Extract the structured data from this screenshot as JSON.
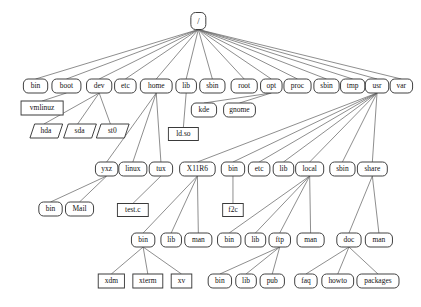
{
  "diagram": {
    "background_color": "#ffffff",
    "node_fill": "#ffffff",
    "node_stroke": "#333333",
    "edge_color": "#6d6d6d",
    "text_color": "#111111",
    "shape_legend": {
      "rounded": "directory",
      "rect": "file",
      "parallelogram": "device-node"
    },
    "nodes": [
      {
        "id": "root",
        "label": "/",
        "shape": "rounded",
        "x": 212,
        "y": 21,
        "w": 16,
        "h": 17,
        "fs": 9
      },
      {
        "id": "bin",
        "label": "bin",
        "shape": "rounded",
        "x": 38,
        "y": 86,
        "w": 26,
        "h": 14,
        "fs": 8
      },
      {
        "id": "boot",
        "label": "boot",
        "shape": "rounded",
        "x": 71,
        "y": 86,
        "w": 31,
        "h": 14,
        "fs": 8
      },
      {
        "id": "dev",
        "label": "dev",
        "shape": "rounded",
        "x": 106,
        "y": 86,
        "w": 27,
        "h": 14,
        "fs": 8
      },
      {
        "id": "etc",
        "label": "etc",
        "shape": "rounded",
        "x": 134,
        "y": 86,
        "w": 23,
        "h": 14,
        "fs": 8
      },
      {
        "id": "home",
        "label": "home",
        "shape": "rounded",
        "x": 167,
        "y": 86,
        "w": 34,
        "h": 14,
        "fs": 8
      },
      {
        "id": "lib",
        "label": "lib",
        "shape": "rounded",
        "x": 199,
        "y": 86,
        "w": 22,
        "h": 14,
        "fs": 8
      },
      {
        "id": "sbin2",
        "label": "sbin",
        "shape": "rounded",
        "x": 227,
        "y": 86,
        "w": 27,
        "h": 14,
        "fs": 8
      },
      {
        "id": "rootdir",
        "label": "root",
        "shape": "rounded",
        "x": 261,
        "y": 86,
        "w": 28,
        "h": 14,
        "fs": 8
      },
      {
        "id": "opt",
        "label": "opt",
        "shape": "rounded",
        "x": 290,
        "y": 86,
        "w": 23,
        "h": 14,
        "fs": 8
      },
      {
        "id": "proc",
        "label": "proc",
        "shape": "rounded",
        "x": 318,
        "y": 86,
        "w": 29,
        "h": 14,
        "fs": 8
      },
      {
        "id": "sbin3",
        "label": "sbin",
        "shape": "rounded",
        "x": 349,
        "y": 86,
        "w": 27,
        "h": 14,
        "fs": 8
      },
      {
        "id": "tmp",
        "label": "tmp",
        "shape": "rounded",
        "x": 377,
        "y": 86,
        "w": 26,
        "h": 14,
        "fs": 8
      },
      {
        "id": "usr",
        "label": "usr",
        "shape": "rounded",
        "x": 403,
        "y": 86,
        "w": 25,
        "h": 14,
        "fs": 8
      },
      {
        "id": "var",
        "label": "var",
        "shape": "rounded",
        "x": 429,
        "y": 86,
        "w": 24,
        "h": 14,
        "fs": 8
      },
      {
        "id": "vmlinuz",
        "label": "vmlinuz",
        "shape": "rect",
        "x": 45,
        "y": 108,
        "w": 45,
        "h": 14,
        "fs": 8
      },
      {
        "id": "kde",
        "label": "kde",
        "shape": "rounded",
        "x": 218,
        "y": 110,
        "w": 27,
        "h": 14,
        "fs": 8
      },
      {
        "id": "gnome",
        "label": "gnome",
        "shape": "rounded",
        "x": 256,
        "y": 110,
        "w": 34,
        "h": 14,
        "fs": 8
      },
      {
        "id": "hda",
        "label": "hda",
        "shape": "para",
        "x": 47,
        "y": 131,
        "w": 30,
        "h": 14,
        "fs": 8
      },
      {
        "id": "sda",
        "label": "sda",
        "shape": "para",
        "x": 83,
        "y": 131,
        "w": 30,
        "h": 14,
        "fs": 8
      },
      {
        "id": "st0",
        "label": "st0",
        "shape": "para",
        "x": 118,
        "y": 131,
        "w": 30,
        "h": 14,
        "fs": 8
      },
      {
        "id": "ldso",
        "label": "ld.so",
        "shape": "rect",
        "x": 196,
        "y": 134,
        "w": 32,
        "h": 13,
        "fs": 8
      },
      {
        "id": "yxz",
        "label": "yxz",
        "shape": "rounded",
        "x": 114,
        "y": 169,
        "w": 24,
        "h": 14,
        "fs": 8
      },
      {
        "id": "linux",
        "label": "linux",
        "shape": "rounded",
        "x": 142,
        "y": 169,
        "w": 30,
        "h": 14,
        "fs": 8
      },
      {
        "id": "tux",
        "label": "tux",
        "shape": "rounded",
        "x": 172,
        "y": 169,
        "w": 25,
        "h": 14,
        "fs": 8
      },
      {
        "id": "x11r6",
        "label": "X11R6",
        "shape": "rounded",
        "x": 211,
        "y": 169,
        "w": 38,
        "h": 14,
        "fs": 8
      },
      {
        "id": "usrbin",
        "label": "bin",
        "shape": "rounded",
        "x": 249,
        "y": 169,
        "w": 25,
        "h": 14,
        "fs": 8
      },
      {
        "id": "usretc",
        "label": "etc",
        "shape": "rounded",
        "x": 277,
        "y": 169,
        "w": 23,
        "h": 14,
        "fs": 8
      },
      {
        "id": "usrlib",
        "label": "lib",
        "shape": "rounded",
        "x": 303,
        "y": 169,
        "w": 22,
        "h": 14,
        "fs": 8
      },
      {
        "id": "local",
        "label": "local",
        "shape": "rounded",
        "x": 331,
        "y": 169,
        "w": 30,
        "h": 14,
        "fs": 8
      },
      {
        "id": "usrsbin",
        "label": "sbin",
        "shape": "rounded",
        "x": 366,
        "y": 169,
        "w": 27,
        "h": 14,
        "fs": 8
      },
      {
        "id": "share",
        "label": "share",
        "shape": "rounded",
        "x": 398,
        "y": 169,
        "w": 32,
        "h": 14,
        "fs": 8
      },
      {
        "id": "homebin",
        "label": "bin",
        "shape": "rounded",
        "x": 54,
        "y": 209,
        "w": 25,
        "h": 14,
        "fs": 8
      },
      {
        "id": "mail",
        "label": "Mail",
        "shape": "rounded",
        "x": 85,
        "y": 209,
        "w": 30,
        "h": 14,
        "fs": 8
      },
      {
        "id": "testc",
        "label": "test.c",
        "shape": "rect",
        "x": 142,
        "y": 210,
        "w": 33,
        "h": 13,
        "fs": 8
      },
      {
        "id": "f2c",
        "label": "f2c",
        "shape": "rect",
        "x": 249,
        "y": 210,
        "w": 22,
        "h": 13,
        "fs": 8
      },
      {
        "id": "x11bin",
        "label": "bin",
        "shape": "rounded",
        "x": 153,
        "y": 240,
        "w": 25,
        "h": 14,
        "fs": 8
      },
      {
        "id": "x11lib",
        "label": "lib",
        "shape": "rounded",
        "x": 183,
        "y": 240,
        "w": 22,
        "h": 14,
        "fs": 8
      },
      {
        "id": "x11man",
        "label": "man",
        "shape": "rounded",
        "x": 212,
        "y": 240,
        "w": 29,
        "h": 14,
        "fs": 8
      },
      {
        "id": "locbin",
        "label": "bin",
        "shape": "rounded",
        "x": 245,
        "y": 240,
        "w": 25,
        "h": 14,
        "fs": 8
      },
      {
        "id": "loclib",
        "label": "lib",
        "shape": "rounded",
        "x": 273,
        "y": 240,
        "w": 22,
        "h": 14,
        "fs": 8
      },
      {
        "id": "ftp",
        "label": "ftp",
        "shape": "rounded",
        "x": 299,
        "y": 240,
        "w": 23,
        "h": 14,
        "fs": 8
      },
      {
        "id": "locman",
        "label": "man",
        "shape": "rounded",
        "x": 332,
        "y": 240,
        "w": 29,
        "h": 14,
        "fs": 8
      },
      {
        "id": "doc",
        "label": "doc",
        "shape": "rounded",
        "x": 373,
        "y": 240,
        "w": 26,
        "h": 14,
        "fs": 8
      },
      {
        "id": "shareman",
        "label": "man",
        "shape": "rounded",
        "x": 405,
        "y": 240,
        "w": 29,
        "h": 14,
        "fs": 8
      },
      {
        "id": "xdm",
        "label": "xdm",
        "shape": "rect",
        "x": 119,
        "y": 281,
        "w": 28,
        "h": 14,
        "fs": 8
      },
      {
        "id": "xterm",
        "label": "xterm",
        "shape": "rect",
        "x": 158,
        "y": 281,
        "w": 32,
        "h": 14,
        "fs": 8
      },
      {
        "id": "xv",
        "label": "xv",
        "shape": "rect",
        "x": 194,
        "y": 281,
        "w": 22,
        "h": 14,
        "fs": 8
      },
      {
        "id": "ftpbin",
        "label": "bin",
        "shape": "rounded",
        "x": 235,
        "y": 281,
        "w": 25,
        "h": 14,
        "fs": 8
      },
      {
        "id": "ftplib",
        "label": "lib",
        "shape": "rounded",
        "x": 263,
        "y": 281,
        "w": 22,
        "h": 14,
        "fs": 8
      },
      {
        "id": "pub",
        "label": "pub",
        "shape": "rounded",
        "x": 291,
        "y": 281,
        "w": 26,
        "h": 14,
        "fs": 8
      },
      {
        "id": "faq",
        "label": "faq",
        "shape": "rounded",
        "x": 327,
        "y": 281,
        "w": 24,
        "h": 14,
        "fs": 8
      },
      {
        "id": "howto",
        "label": "howto",
        "shape": "rounded",
        "x": 361,
        "y": 281,
        "w": 34,
        "h": 14,
        "fs": 8
      },
      {
        "id": "packages",
        "label": "packages",
        "shape": "rounded",
        "x": 404,
        "y": 281,
        "w": 45,
        "h": 14,
        "fs": 8
      }
    ],
    "edges": [
      {
        "from": "root",
        "to": "bin"
      },
      {
        "from": "root",
        "to": "boot"
      },
      {
        "from": "root",
        "to": "dev"
      },
      {
        "from": "root",
        "to": "etc"
      },
      {
        "from": "root",
        "to": "home"
      },
      {
        "from": "root",
        "to": "lib"
      },
      {
        "from": "root",
        "to": "sbin2"
      },
      {
        "from": "root",
        "to": "rootdir"
      },
      {
        "from": "root",
        "to": "opt"
      },
      {
        "from": "root",
        "to": "proc"
      },
      {
        "from": "root",
        "to": "sbin3"
      },
      {
        "from": "root",
        "to": "tmp"
      },
      {
        "from": "root",
        "to": "usr"
      },
      {
        "from": "root",
        "to": "var"
      },
      {
        "from": "boot",
        "to": "vmlinuz"
      },
      {
        "from": "dev",
        "to": "hda"
      },
      {
        "from": "dev",
        "to": "sda"
      },
      {
        "from": "dev",
        "to": "st0"
      },
      {
        "from": "lib",
        "to": "ldso"
      },
      {
        "from": "opt",
        "to": "kde"
      },
      {
        "from": "opt",
        "to": "gnome"
      },
      {
        "from": "home",
        "to": "yxz"
      },
      {
        "from": "home",
        "to": "linux"
      },
      {
        "from": "home",
        "to": "tux"
      },
      {
        "from": "usr",
        "to": "x11r6"
      },
      {
        "from": "usr",
        "to": "usrbin"
      },
      {
        "from": "usr",
        "to": "usretc"
      },
      {
        "from": "usr",
        "to": "usrlib"
      },
      {
        "from": "usr",
        "to": "local"
      },
      {
        "from": "usr",
        "to": "usrsbin"
      },
      {
        "from": "usr",
        "to": "share"
      },
      {
        "from": "yxz",
        "to": "homebin"
      },
      {
        "from": "yxz",
        "to": "mail"
      },
      {
        "from": "tux",
        "to": "testc"
      },
      {
        "from": "usrbin",
        "to": "f2c"
      },
      {
        "from": "x11r6",
        "to": "x11bin"
      },
      {
        "from": "x11r6",
        "to": "x11lib"
      },
      {
        "from": "x11r6",
        "to": "x11man"
      },
      {
        "from": "local",
        "to": "locbin"
      },
      {
        "from": "local",
        "to": "loclib"
      },
      {
        "from": "local",
        "to": "ftp"
      },
      {
        "from": "local",
        "to": "locman"
      },
      {
        "from": "share",
        "to": "doc"
      },
      {
        "from": "share",
        "to": "shareman"
      },
      {
        "from": "x11bin",
        "to": "xdm"
      },
      {
        "from": "x11bin",
        "to": "xterm"
      },
      {
        "from": "x11bin",
        "to": "xv"
      },
      {
        "from": "ftp",
        "to": "ftpbin"
      },
      {
        "from": "ftp",
        "to": "ftplib"
      },
      {
        "from": "ftp",
        "to": "pub"
      },
      {
        "from": "doc",
        "to": "faq"
      },
      {
        "from": "doc",
        "to": "howto"
      },
      {
        "from": "doc",
        "to": "packages"
      }
    ]
  }
}
